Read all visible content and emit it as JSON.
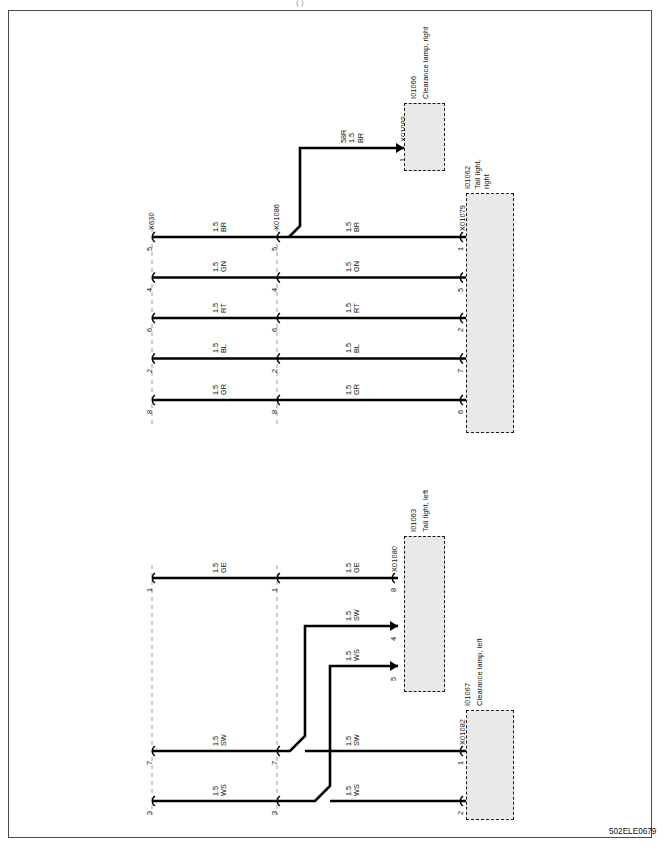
{
  "document": {
    "footer_code": "502ELE0679",
    "top_mark": "(  )",
    "sheet_border_color": "#4a4a4a",
    "wire_color": "#000000",
    "connector_fill": "#e9e9e9",
    "connector_border": "#1a1a1a",
    "bus_dash_color": "#9e9e9e"
  },
  "connectors": {
    "x630": {
      "label": "X630"
    },
    "x01086": {
      "label": "X01086"
    },
    "x01079": {
      "label": "X01079"
    },
    "x01083": {
      "label": "X01083"
    },
    "x01080": {
      "label": "X01080"
    },
    "x01082": {
      "label": "X01082"
    }
  },
  "devices": [
    {
      "id": "I01066",
      "name": "Clearance lamp, right",
      "connector": "X01083"
    },
    {
      "id": "I01062",
      "name": "Tail light,\nright",
      "connector": "X01079"
    },
    {
      "id": "I01063",
      "name": "Tail light, left",
      "connector": "X01080"
    },
    {
      "id": "I01067",
      "name": "Clearance lamp, left",
      "connector": "X01082"
    }
  ],
  "device_labels": {
    "i01066_id": "I01066",
    "i01066_name": "Clearance lamp, right",
    "i01062_id": "I01062",
    "i01062_name_l1": "Tail light,",
    "i01062_name_l2": "right",
    "i01063_id": "I01063",
    "i01063_name": "Tail light, left",
    "i01067_id": "I01067",
    "i01067_name": "Clearance lamp, left"
  },
  "upper_section": {
    "rows": [
      {
        "left_pin": "5",
        "mid_pin": "5",
        "right_pin": "1",
        "left_wire_size": "1.5",
        "left_wire_color": "BR",
        "right_wire_size": "1.5",
        "right_wire_color": "BR"
      },
      {
        "left_pin": "4",
        "mid_pin": "4",
        "right_pin": "5",
        "left_wire_size": "1.5",
        "left_wire_color": "GN",
        "right_wire_size": "1.5",
        "right_wire_color": "GN"
      },
      {
        "left_pin": "6",
        "mid_pin": "6",
        "right_pin": "2",
        "left_wire_size": "1.5",
        "left_wire_color": "RT",
        "right_wire_size": "1.5",
        "right_wire_color": "RT"
      },
      {
        "left_pin": "2",
        "mid_pin": "2",
        "right_pin": "7",
        "left_wire_size": "1.5",
        "left_wire_color": "BL",
        "right_wire_size": "1.5",
        "right_wire_color": "BL"
      },
      {
        "left_pin": "8",
        "mid_pin": "8",
        "right_pin": "6",
        "left_wire_size": "1.5",
        "left_wire_color": "GR",
        "right_wire_size": "1.5",
        "right_wire_color": "GR"
      }
    ],
    "branch": {
      "circuit": "58R",
      "size": "1.5",
      "color": "BR",
      "target_pin": "1",
      "target_connector": "X01083"
    }
  },
  "lower_section": {
    "rows": [
      {
        "left_pin": "1",
        "mid_pin": "1",
        "right_pin": "8",
        "left_wire_size": "1.5",
        "left_wire_color": "GE",
        "right_wire_size": "1.5",
        "right_wire_color": "GE"
      },
      {
        "left_pin": "7",
        "mid_pin": "7",
        "right_pin": "1",
        "left_wire_size": "1.5",
        "left_wire_color": "SW",
        "right_wire_size": "1.5",
        "right_wire_color": "SW"
      },
      {
        "left_pin": "3",
        "mid_pin": "3",
        "right_pin": "2",
        "left_wire_size": "1.5",
        "left_wire_color": "WS",
        "right_wire_size": "1.5",
        "right_wire_color": "WS"
      }
    ],
    "branches": [
      {
        "size": "1.5",
        "color": "SW",
        "target_pin": "4",
        "target_connector": "X01080"
      },
      {
        "size": "1.5",
        "color": "WS",
        "target_pin": "5",
        "target_connector": "X01080"
      }
    ]
  }
}
